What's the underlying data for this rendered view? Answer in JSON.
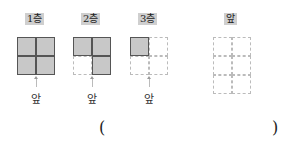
{
  "floors": [
    {
      "label": "1층",
      "cells": [
        [
          1,
          1
        ],
        [
          1,
          1
        ]
      ]
    },
    {
      "label": "2층",
      "cells": [
        [
          1,
          1
        ],
        [
          0,
          1
        ]
      ]
    },
    {
      "label": "3층",
      "cells": [
        [
          1,
          0
        ],
        [
          0,
          0
        ]
      ]
    }
  ],
  "front_label": "앞",
  "answer_grid": {
    "label": "앞",
    "rows": 3,
    "cols": 2
  },
  "answer": {
    "open": "(",
    "close": ")",
    "value": ""
  },
  "colors": {
    "filled": "#c8c8c8",
    "label_bg": "#cfcfcf",
    "dashed": "#bbbbbb"
  }
}
